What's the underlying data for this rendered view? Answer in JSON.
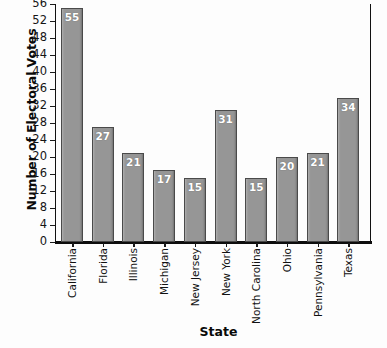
{
  "chart_data": {
    "type": "bar",
    "title": "",
    "xlabel": "State",
    "ylabel": "Number of Electoral Votes",
    "categories": [
      "California",
      "Florida",
      "Illinois",
      "Michigan",
      "New Jersey",
      "New York",
      "North Carolina",
      "Ohio",
      "Pennsylvania",
      "Texas"
    ],
    "values": [
      55,
      27,
      21,
      17,
      15,
      31,
      15,
      20,
      21,
      34
    ],
    "value_labels": [
      "55",
      "27",
      "21",
      "17",
      "15",
      "31",
      "15",
      "20",
      "21",
      "34"
    ],
    "ylim": [
      0,
      56
    ],
    "ytick_step": 4,
    "yticks": [
      0,
      4,
      8,
      12,
      16,
      20,
      24,
      28,
      32,
      36,
      40,
      44,
      48,
      52,
      56
    ],
    "ytick_labels": [
      "0",
      "4",
      "8",
      "12",
      "16",
      "20",
      "24",
      "28",
      "32",
      "36",
      "40",
      "44",
      "48",
      "52",
      "56"
    ],
    "grid": false,
    "legend": null,
    "legend_position": "none",
    "bar_color": "#969696",
    "bar_edge_color": "#4a4a4a",
    "value_label_color": "#ffffff",
    "axis_color": "#111111",
    "background_color": "#fdfdfd",
    "xlabel_rotation": 90
  }
}
